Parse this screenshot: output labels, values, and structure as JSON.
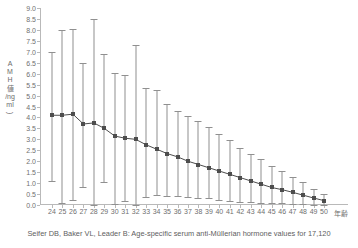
{
  "chart_data": {
    "type": "line",
    "title": "",
    "subtitle": "",
    "xlabel": "年齢",
    "ylabel": "AMH値(ng/ml)",
    "ylabel_chars": [
      "A",
      "M",
      "H",
      "値",
      "/ng",
      "ml"
    ],
    "ylim": [
      0.0,
      9.0
    ],
    "ytick_step": 0.5,
    "yticks": [
      "9.0",
      "8.5",
      "8.0",
      "7.5",
      "7.0",
      "6.5",
      "6.0",
      "5.5",
      "5.0",
      "4.5",
      "4.0",
      "3.5",
      "3.0",
      "2.5",
      "2.0",
      "1.5",
      "1.0",
      "0.5",
      "0.0"
    ],
    "grid": false,
    "legend": "none",
    "marker_color": "#4d4d4d",
    "errorbar_color": "#909090",
    "axis_color": "#b9b9b9",
    "categories": [
      24,
      25,
      26,
      27,
      28,
      29,
      30,
      31,
      32,
      33,
      34,
      35,
      36,
      37,
      38,
      39,
      40,
      41,
      42,
      43,
      44,
      45,
      46,
      47,
      48,
      49,
      50
    ],
    "series": [
      {
        "name": "AMH median",
        "values": [
          4.1,
          4.1,
          4.15,
          3.7,
          3.75,
          3.5,
          3.15,
          3.05,
          3.0,
          2.75,
          2.55,
          2.35,
          2.2,
          2.0,
          1.85,
          1.7,
          1.55,
          1.4,
          1.25,
          1.1,
          0.95,
          0.8,
          0.7,
          0.58,
          0.45,
          0.32,
          0.2
        ]
      }
    ],
    "error_upper": [
      7.0,
      8.0,
      8.05,
      6.5,
      8.5,
      6.9,
      6.05,
      5.95,
      7.3,
      5.35,
      5.25,
      4.6,
      4.3,
      4.05,
      3.85,
      3.55,
      3.25,
      2.95,
      2.6,
      2.35,
      2.1,
      1.8,
      1.55,
      1.3,
      1.05,
      0.75,
      0.5
    ],
    "error_lower": [
      1.1,
      0.1,
      0.25,
      0.8,
      0.0,
      1.05,
      0.05,
      0.2,
      0.0,
      0.35,
      0.45,
      0.4,
      0.4,
      0.35,
      0.3,
      0.3,
      0.25,
      0.2,
      0.15,
      0.15,
      0.1,
      0.1,
      0.08,
      0.05,
      0.05,
      0.02,
      0.02
    ]
  },
  "caption": {
    "text": "Seifer DB, Baker VL, Leader B: Age-specific serum anti-Müllerian hormone values for 17,120"
  }
}
